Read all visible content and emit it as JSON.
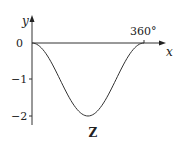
{
  "chart_data": {
    "type": "line",
    "title": "Z",
    "xlabel": "x",
    "ylabel": "y",
    "x_tick_labels": [
      "360°"
    ],
    "y_tick_labels": [
      "0",
      "−1",
      "−2"
    ],
    "y_ticks": [
      0,
      -1,
      -2
    ],
    "xlim": [
      0,
      360
    ],
    "ylim": [
      -2,
      0
    ],
    "grid": false,
    "series": [
      {
        "name": "y = cos x − 1",
        "x": [
          0,
          45,
          90,
          135,
          180,
          225,
          270,
          315,
          360
        ],
        "values": [
          0,
          -0.29,
          -1,
          -1.71,
          -2,
          -1.71,
          -1,
          -0.29,
          0
        ]
      }
    ]
  },
  "labels": {
    "y_axis": "y",
    "x_axis": "x",
    "x_tick_360": "360°",
    "y_tick_0": "0",
    "y_tick_m1": "−1",
    "y_tick_m2": "−2",
    "caption": "Z"
  }
}
